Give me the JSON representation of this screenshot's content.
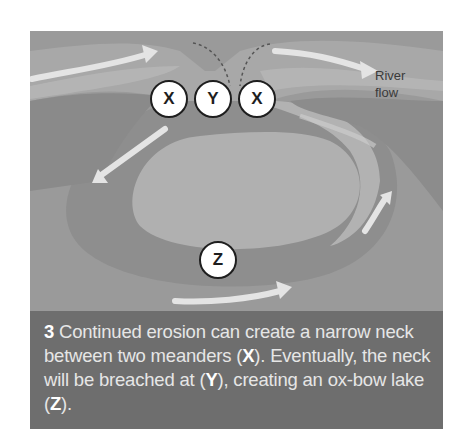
{
  "diagram": {
    "labels": {
      "river_flow_line1": "River",
      "river_flow_line2": "flow"
    },
    "markers": [
      {
        "id": "x-left",
        "text": "X"
      },
      {
        "id": "y",
        "text": "Y"
      },
      {
        "id": "x-right",
        "text": "X"
      },
      {
        "id": "z",
        "text": "Z"
      }
    ],
    "colors": {
      "land": "#9a9a9a",
      "river_dark": "#8a8a8a",
      "river_light": "#b4b4b4",
      "arrow": "#e6e6e6",
      "caption_bg": "#6e6e6e"
    }
  },
  "caption": {
    "step": "3",
    "part1": " Continued erosion can create a narrow neck between two meanders (",
    "x": "X",
    "part2": "). Eventually, the neck will be breached at (",
    "y": "Y",
    "part3": "), creating an ox-bow lake (",
    "z": "Z",
    "part4": ")."
  }
}
